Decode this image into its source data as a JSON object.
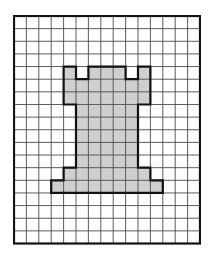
{
  "figure": {
    "grid": {
      "cols": 15,
      "rows": 18,
      "cell_w": 12.4,
      "cell_h": 12.64
    },
    "colors": {
      "background": "#ffffff",
      "grid_line": "#4a4a4a",
      "border": "#111111",
      "fill": "#cfcfcf",
      "outline": "#111111"
    },
    "filled_cells": {
      "4": [
        4,
        6,
        7,
        8,
        10
      ],
      "5": [
        4,
        5,
        6,
        7,
        8,
        9,
        10
      ],
      "6": [
        4,
        5,
        6,
        7,
        8,
        9,
        10
      ],
      "7": [
        5,
        6,
        7,
        8,
        9
      ],
      "8": [
        5,
        6,
        7,
        8,
        9
      ],
      "9": [
        5,
        6,
        7,
        8,
        9
      ],
      "10": [
        5,
        6,
        7,
        8,
        9
      ],
      "11": [
        5,
        6,
        7,
        8,
        9
      ],
      "12": [
        4,
        5,
        6,
        7,
        8,
        9,
        10
      ],
      "13": [
        3,
        4,
        5,
        6,
        7,
        8,
        9,
        10,
        11
      ]
    },
    "outline_path_cells": [
      [
        4,
        4
      ],
      [
        5,
        4
      ],
      [
        5,
        5
      ],
      [
        6,
        5
      ],
      [
        6,
        4
      ],
      [
        9,
        4
      ],
      [
        9,
        5
      ],
      [
        10,
        5
      ],
      [
        10,
        4
      ],
      [
        11,
        4
      ],
      [
        11,
        7
      ],
      [
        10,
        7
      ],
      [
        10,
        12
      ],
      [
        11,
        12
      ],
      [
        11,
        13
      ],
      [
        12,
        13
      ],
      [
        12,
        14
      ],
      [
        3,
        14
      ],
      [
        3,
        13
      ],
      [
        4,
        13
      ],
      [
        4,
        12
      ],
      [
        5,
        12
      ],
      [
        5,
        7
      ],
      [
        4,
        7
      ],
      [
        4,
        4
      ]
    ]
  }
}
